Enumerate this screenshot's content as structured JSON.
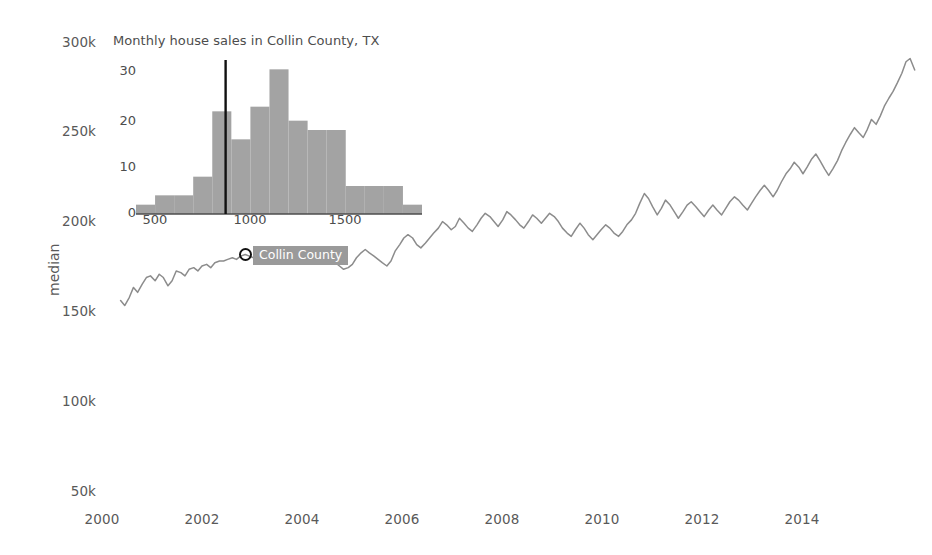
{
  "main": {
    "axis_y_title": "median",
    "y_ticks": [
      "300k",
      "250k",
      "200k",
      "150k",
      "100k",
      "50k"
    ],
    "x_ticks": [
      "2000",
      "2002",
      "2004",
      "2006",
      "2008",
      "2010",
      "2012",
      "2014"
    ],
    "tooltip": {
      "label": "Collin County",
      "marker_icon": "circle-marker-icon",
      "bg_color": "#9a9a9a",
      "text_color": "#ffffff"
    },
    "line_color": "#8c8c8c"
  },
  "inset": {
    "title": "Monthly house sales in Collin County, TX",
    "y_ticks": [
      "0",
      "10",
      "20",
      "30"
    ],
    "x_ticks": [
      "500",
      "1000",
      "1500"
    ],
    "bar_color": "#a3a3a3",
    "rule_color": "#111111"
  },
  "chart_data": [
    {
      "type": "line",
      "title": "",
      "xlabel": "",
      "ylabel": "median",
      "xlim": [
        1999.6,
        2015.6
      ],
      "ylim": [
        41000,
        313000
      ],
      "grid": false,
      "legend": "inline-label",
      "series": [
        {
          "name": "Collin County",
          "x": [
            2000.0,
            2000.08,
            2000.17,
            2000.25,
            2000.33,
            2000.42,
            2000.5,
            2000.58,
            2000.67,
            2000.75,
            2000.83,
            2000.92,
            2001.0,
            2001.08,
            2001.17,
            2001.25,
            2001.33,
            2001.42,
            2001.5,
            2001.58,
            2001.67,
            2001.75,
            2001.83,
            2001.92,
            2002.0,
            2002.08,
            2002.17,
            2002.25,
            2002.33,
            2002.42,
            2002.5,
            2002.58,
            2002.67,
            2002.75,
            2002.83,
            2002.92,
            2003.0,
            2003.08,
            2003.17,
            2003.25,
            2003.33,
            2003.42,
            2003.5,
            2003.58,
            2003.67,
            2003.75,
            2003.83,
            2003.92,
            2004.0,
            2004.08,
            2004.17,
            2004.25,
            2004.33,
            2004.42,
            2004.5,
            2004.58,
            2004.67,
            2004.75,
            2004.83,
            2004.92,
            2005.0,
            2005.08,
            2005.17,
            2005.25,
            2005.33,
            2005.42,
            2005.5,
            2005.58,
            2005.67,
            2005.75,
            2005.83,
            2005.92,
            2006.0,
            2006.08,
            2006.17,
            2006.25,
            2006.33,
            2006.42,
            2006.5,
            2006.58,
            2006.67,
            2006.75,
            2006.83,
            2006.92,
            2007.0,
            2007.08,
            2007.17,
            2007.25,
            2007.33,
            2007.42,
            2007.5,
            2007.58,
            2007.67,
            2007.75,
            2007.83,
            2007.92,
            2008.0,
            2008.08,
            2008.17,
            2008.25,
            2008.33,
            2008.42,
            2008.5,
            2008.58,
            2008.67,
            2008.75,
            2008.83,
            2008.92,
            2009.0,
            2009.08,
            2009.17,
            2009.25,
            2009.33,
            2009.42,
            2009.5,
            2009.58,
            2009.67,
            2009.75,
            2009.83,
            2009.92,
            2010.0,
            2010.08,
            2010.17,
            2010.25,
            2010.33,
            2010.42,
            2010.5,
            2010.58,
            2010.67,
            2010.75,
            2010.83,
            2010.92,
            2011.0,
            2011.08,
            2011.17,
            2011.25,
            2011.33,
            2011.42,
            2011.5,
            2011.58,
            2011.67,
            2011.75,
            2011.83,
            2011.92,
            2012.0,
            2012.08,
            2012.17,
            2012.25,
            2012.33,
            2012.42,
            2012.5,
            2012.58,
            2012.67,
            2012.75,
            2012.83,
            2012.92,
            2013.0,
            2013.08,
            2013.17,
            2013.25,
            2013.33,
            2013.42,
            2013.5,
            2013.58,
            2013.67,
            2013.75,
            2013.83,
            2013.92,
            2014.0,
            2014.08,
            2014.17,
            2014.25,
            2014.33,
            2014.42,
            2014.5,
            2014.58,
            2014.67,
            2014.75,
            2014.83,
            2014.92,
            2015.0,
            2015.08,
            2015.17,
            2015.25,
            2015.33,
            2015.42
          ],
          "y": [
            156000,
            153000,
            158000,
            164000,
            161000,
            166000,
            170000,
            171000,
            168000,
            172000,
            170000,
            165000,
            168000,
            174000,
            173000,
            171000,
            175000,
            176000,
            174000,
            177000,
            178000,
            176000,
            179000,
            180000,
            180000,
            181000,
            182000,
            181000,
            183000,
            184000,
            183000,
            182000,
            184000,
            183000,
            185000,
            187000,
            186000,
            184000,
            183000,
            181000,
            180000,
            179000,
            178000,
            180000,
            181000,
            180000,
            182000,
            183000,
            182000,
            181000,
            179000,
            177000,
            175000,
            176000,
            178000,
            182000,
            185000,
            187000,
            185000,
            183000,
            181000,
            179000,
            177000,
            180000,
            186000,
            190000,
            194000,
            196000,
            194000,
            190000,
            188000,
            191000,
            194000,
            197000,
            200000,
            204000,
            202000,
            199000,
            201000,
            206000,
            203000,
            200000,
            198000,
            202000,
            206000,
            209000,
            207000,
            204000,
            201000,
            205000,
            210000,
            208000,
            205000,
            202000,
            200000,
            204000,
            208000,
            206000,
            203000,
            206000,
            209000,
            207000,
            204000,
            200000,
            197000,
            195000,
            199000,
            203000,
            200000,
            196000,
            193000,
            196000,
            199000,
            202000,
            200000,
            197000,
            195000,
            198000,
            202000,
            205000,
            209000,
            215000,
            221000,
            218000,
            213000,
            208000,
            212000,
            217000,
            214000,
            210000,
            206000,
            210000,
            214000,
            216000,
            213000,
            210000,
            207000,
            211000,
            214000,
            211000,
            208000,
            212000,
            216000,
            219000,
            217000,
            214000,
            211000,
            215000,
            219000,
            223000,
            226000,
            223000,
            219000,
            223000,
            228000,
            233000,
            236000,
            240000,
            237000,
            233000,
            237000,
            242000,
            245000,
            241000,
            236000,
            232000,
            236000,
            241000,
            247000,
            252000,
            257000,
            261000,
            258000,
            255000,
            260000,
            266000,
            263000,
            268000,
            274000,
            279000,
            283000,
            288000,
            294000,
            301000,
            303000,
            296000
          ]
        }
      ],
      "annotations": [
        {
          "label": "Collin County",
          "x": 2002.8,
          "y": 184000
        }
      ]
    },
    {
      "type": "bar",
      "title": "Monthly house sales in Collin County, TX",
      "xlabel": "",
      "ylabel": "",
      "bin_edges": [
        400,
        500,
        600,
        700,
        800,
        900,
        1000,
        1100,
        1200,
        1300,
        1400,
        1500,
        1600,
        1700,
        1800,
        1900
      ],
      "values": [
        2,
        4,
        4,
        8,
        22,
        16,
        23,
        31,
        20,
        18,
        18,
        6,
        6,
        6,
        2
      ],
      "categories": [
        "400-500",
        "500-600",
        "600-700",
        "700-800",
        "800-900",
        "900-1000",
        "1000-1100",
        "1100-1200",
        "1200-1300",
        "1300-1400",
        "1400-1500",
        "1500-1600",
        "1600-1700",
        "1700-1800",
        "1800-1900"
      ],
      "xlim": [
        400,
        1900
      ],
      "ylim": [
        0,
        33
      ],
      "grid": false,
      "vertical_rule_x": 870,
      "x_ticks": [
        500,
        1000,
        1500
      ],
      "y_ticks": [
        0,
        10,
        20,
        30
      ]
    }
  ]
}
